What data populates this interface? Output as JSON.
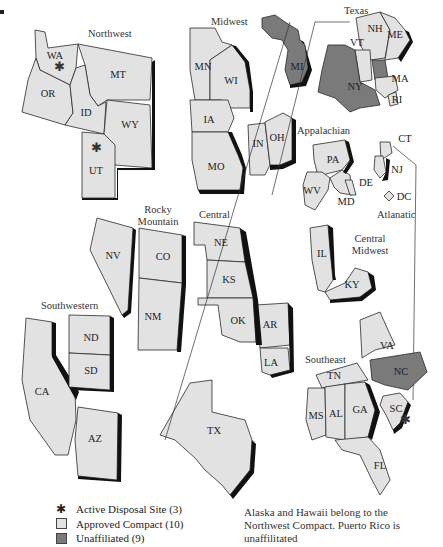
{
  "colors": {
    "approved": "#e2e2e2",
    "unaffiliated": "#7a7a7a",
    "shadow": "#111111",
    "outline": "#2a2a2a"
  },
  "regions": [
    {
      "name": "Northwest",
      "states": [
        "WA",
        "OR",
        "ID",
        "MT",
        "WY",
        "UT"
      ]
    },
    {
      "name": "Midwest",
      "states": [
        "MN",
        "WI",
        "IA",
        "MO",
        "IN",
        "OH"
      ]
    },
    {
      "name": "Texas",
      "states": [
        "TX",
        "VT"
      ]
    },
    {
      "name": "Rocky Mountain",
      "states": [
        "NV",
        "CO",
        "NM"
      ]
    },
    {
      "name": "Central",
      "states": [
        "NE",
        "KS",
        "OK",
        "AR",
        "LA"
      ]
    },
    {
      "name": "Southwestern",
      "states": [
        "CA",
        "AZ",
        "ND",
        "SD"
      ]
    },
    {
      "name": "Appalachian",
      "states": [
        "PA",
        "WV",
        "MD",
        "DE"
      ]
    },
    {
      "name": "Atlanatic",
      "states": [
        "CT",
        "NJ",
        "SC"
      ]
    },
    {
      "name": "Central Midwest",
      "states": [
        "IL",
        "KY"
      ]
    },
    {
      "name": "Southeast",
      "states": [
        "TN",
        "MS",
        "AL",
        "GA",
        "FL",
        "VA"
      ]
    }
  ],
  "region_labels": {
    "northwest": "Northwest",
    "midwest": "Midwest",
    "texas": "Texas",
    "rocky": "Rocky Mountain",
    "central": "Central",
    "southwestern": "Southwestern",
    "appalachian": "Appalachian",
    "atlantic": "Atlanatic",
    "central_midwest": "Central Midwest",
    "southeast": "Southeast"
  },
  "state_labels": {
    "WA": "WA",
    "OR": "OR",
    "ID": "ID",
    "MT": "MT",
    "WY": "WY",
    "UT": "UT",
    "MN": "MN",
    "WI": "WI",
    "IA": "IA",
    "MO": "MO",
    "IN": "IN",
    "OH": "OH",
    "MI": "MI",
    "NH": "NH",
    "ME": "ME",
    "VT": "VT",
    "NY": "NY",
    "MA": "MA",
    "RI": "RI",
    "NV": "NV",
    "CO": "CO",
    "NM": "NM",
    "NE": "NE",
    "KS": "KS",
    "OK": "OK",
    "AR": "AR",
    "LA": "LA",
    "ND": "ND",
    "SD": "SD",
    "CA": "CA",
    "AZ": "AZ",
    "TX": "TX",
    "PA": "PA",
    "WV": "WV",
    "MD": "MD",
    "DE": "DE",
    "CT": "CT",
    "NJ": "NJ",
    "DC": "DC",
    "IL": "IL",
    "KY": "KY",
    "TN": "TN",
    "MS": "MS",
    "AL": "AL",
    "GA": "GA",
    "FL": "FL",
    "VA": "VA",
    "NC": "NC",
    "SC": "SC"
  },
  "unaffiliated_states": [
    "MI",
    "NY",
    "NH-MA",
    "NC",
    "DC"
  ],
  "active_disposal_sites": [
    "WA",
    "UT",
    "SC"
  ],
  "legend": {
    "active_site": "Active Disposal Site (3)",
    "approved": "Approved Compact (10)",
    "unaffiliated": "Unaffiliated (9)"
  },
  "note": "Alaska and Hawaii belong to the Northwest Compact. Puerto Rico is unaffilitated"
}
